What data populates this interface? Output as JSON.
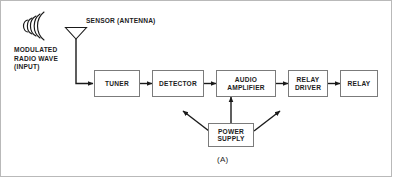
{
  "figure": {
    "caption": "(A)",
    "antenna_label": "SENSOR (ANTENNA)",
    "input_label": "MODULATED\nRADIO WAVE\n(INPUT)"
  },
  "blocks": [
    {
      "id": "tuner",
      "label": "TUNER"
    },
    {
      "id": "detector",
      "label": "DETECTOR"
    },
    {
      "id": "audio-amplifier",
      "label": "AUDIO\nAMPLIFIER"
    },
    {
      "id": "relay-driver",
      "label": "RELAY\nDRIVER"
    },
    {
      "id": "relay",
      "label": "RELAY"
    },
    {
      "id": "power-supply",
      "label": "POWER\nSUPPLY"
    }
  ],
  "icons": {
    "radio_wave": "radio-wave-icon",
    "antenna": "antenna-icon"
  },
  "colors": {
    "stroke": "#7b7b7b",
    "line": "#1a1a1a",
    "frame": "#b9b9b9",
    "background": "#ffffff",
    "text": "#1d1d1d"
  }
}
